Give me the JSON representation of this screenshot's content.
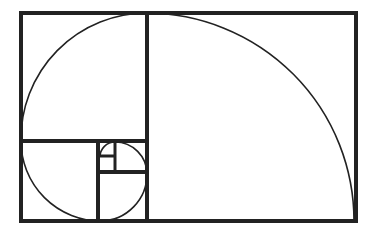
{
  "diagram": {
    "type": "fibonacci-spiral",
    "background": "#ffffff",
    "line_color": "#222222",
    "outer_rect": {
      "x": 21,
      "y": 13,
      "w": 335,
      "h": 208
    },
    "dividers": [
      {
        "x1": 147,
        "y1": 13,
        "x2": 147,
        "y2": 221
      },
      {
        "x1": 21,
        "y1": 141,
        "x2": 147,
        "y2": 141
      },
      {
        "x1": 98,
        "y1": 141,
        "x2": 98,
        "y2": 221
      },
      {
        "x1": 98,
        "y1": 172,
        "x2": 147,
        "y2": 172
      },
      {
        "x1": 115,
        "y1": 141,
        "x2": 115,
        "y2": 172
      },
      {
        "x1": 98,
        "y1": 156,
        "x2": 115,
        "y2": 156
      }
    ]
  }
}
